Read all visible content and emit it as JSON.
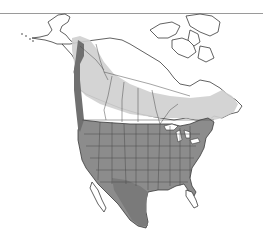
{
  "map": {
    "title": "North America range map",
    "region": "North America",
    "colors": {
      "background": "#ffffff",
      "land": "#ffffff",
      "outline": "#3a3a3a",
      "range_year_round": "#8a8a8a",
      "range_year_round_dark": "#6f6f6f",
      "range_breeding": "#c8c8c8",
      "range_nonbreeding": "#b3b3b3",
      "water": "#ffffff",
      "top_rule": "#9a9a9a"
    },
    "zones": [
      {
        "name": "breeding",
        "shade": "light-gray"
      },
      {
        "name": "year-round",
        "shade": "medium-gray"
      },
      {
        "name": "nonbreeding",
        "shade": "dark-gray"
      }
    ]
  }
}
